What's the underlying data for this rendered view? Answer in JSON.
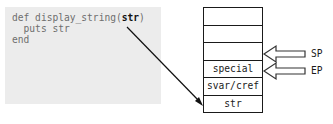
{
  "code": {
    "lines": [
      {
        "before": "def display_string(",
        "highlight": "str",
        "after": ")"
      },
      {
        "before": "  puts str",
        "highlight": "",
        "after": ""
      },
      {
        "before": "end",
        "highlight": "",
        "after": ""
      }
    ]
  },
  "stack": {
    "cells": [
      "",
      "",
      "",
      "special",
      "svar/cref",
      "str"
    ]
  },
  "pointers": {
    "sp": "SP",
    "ep": "EP"
  }
}
